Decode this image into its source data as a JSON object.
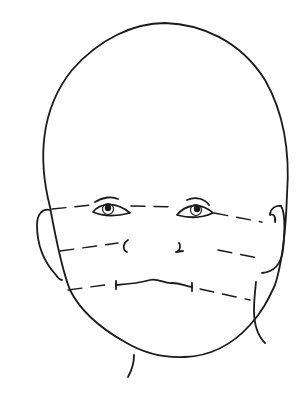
{
  "figure": {
    "title": "Infant face line drawing with horizontal facial proportion guide lines",
    "background": "#ffffff",
    "stroke_color": "#1a1a1a",
    "elements": [
      {
        "name": "head-outline",
        "description": "large rounded cranium and face outline"
      },
      {
        "name": "left-ear",
        "description": "ear on viewer's left"
      },
      {
        "name": "right-ear",
        "description": "ear on viewer's right"
      },
      {
        "name": "left-eye",
        "description": "almond eye with iris and brow crease"
      },
      {
        "name": "right-eye",
        "description": "almond eye with iris and brow crease"
      },
      {
        "name": "nose-nostrils",
        "description": "two small nostril marks"
      },
      {
        "name": "mouth",
        "description": "wavy mouth line with end ticks"
      },
      {
        "name": "neck-lines",
        "description": "neck contours below chin and at right side"
      },
      {
        "name": "guide-line-eyes",
        "description": "dashed horizontal line through eyes"
      },
      {
        "name": "guide-line-nose",
        "description": "dashed horizontal line through nose"
      },
      {
        "name": "guide-line-mouth",
        "description": "dashed horizontal line through mouth"
      }
    ],
    "guide_line_count": 3
  }
}
